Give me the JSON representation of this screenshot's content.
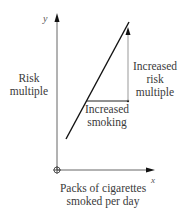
{
  "diagram": {
    "type": "line graph schematic",
    "y_axis": {
      "letter": "y",
      "label": "Risk\nmultiple"
    },
    "x_axis": {
      "letter": "x",
      "label": "Packs of cigarettes smoked per day"
    },
    "annotations": {
      "vertical_change": "Increased risk multiple",
      "horizontal_change": "Increased smoking"
    },
    "line": {
      "description": "Upward-sloping straight line",
      "start": [
        66,
        139
      ],
      "end": [
        129,
        22
      ]
    },
    "colors": {
      "line": "#111111",
      "axis": "#555555",
      "text": "#3a3a3a"
    }
  }
}
